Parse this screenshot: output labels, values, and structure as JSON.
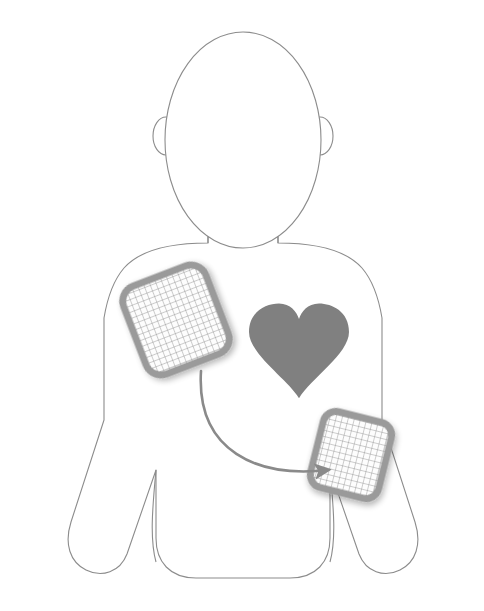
{
  "diagram": {
    "background_color": "#ffffff",
    "canvas": {
      "width": 484,
      "height": 611
    }
  },
  "body_outline": {
    "name": "torso-and-head-outline",
    "stroke_color": "#8c8c8c",
    "fill_color": "#ffffff",
    "stroke_width": 1.1,
    "head": {
      "label": "head",
      "shape": "ellipse",
      "cx": 243,
      "cy": 140,
      "rx": 78,
      "ry": 108
    },
    "ear_left": {
      "label": "left-ear",
      "cx": 166,
      "cy": 136,
      "rx": 13,
      "ry": 19
    },
    "ear_right": {
      "label": "right-ear",
      "cx": 320,
      "cy": 136,
      "rx": 13,
      "ry": 19
    },
    "neck": {
      "label": "neck",
      "left_x": 208,
      "right_x": 279,
      "top_y": 232,
      "bottom_y": 243
    },
    "torso": {
      "label": "torso",
      "left_x": 104,
      "right_x": 382,
      "top_y": 243,
      "bottom_y": 578,
      "corner_radius": 40
    },
    "arm_left": {
      "label": "left-arm",
      "shoulder_x": 104,
      "hand_y": 572
    },
    "arm_right": {
      "label": "right-arm",
      "shoulder_x": 382,
      "hand_y": 572
    }
  },
  "heart": {
    "name": "heart",
    "label": "Heart",
    "fill_color": "#808080",
    "center_x": 299,
    "center_y": 352,
    "width": 100,
    "height": 85
  },
  "pads": [
    {
      "id": "pad-upper-right-chest",
      "label": "Upper right chest pad",
      "position_note": "below the right collarbone (viewer's left)",
      "center_x": 176,
      "center_y": 320,
      "width": 88,
      "height": 94,
      "rotation_deg": -21,
      "corner_radius": 16,
      "border_color": "#9a9a9a",
      "border_width": 7,
      "mesh_color": "#8e8e8e",
      "mesh_spacing": 6,
      "fill_color": "#fdfdfd"
    },
    {
      "id": "pad-lower-left-chest",
      "label": "Lower left chest pad",
      "position_note": "lower left side below the armpit (viewer's right)",
      "center_x": 351,
      "center_y": 455,
      "width": 70,
      "height": 78,
      "rotation_deg": 14,
      "corner_radius": 13,
      "border_color": "#9a9a9a",
      "border_width": 7,
      "mesh_color": "#8e8e8e",
      "mesh_spacing": 6,
      "fill_color": "#fdfdfd"
    }
  ],
  "arrow": {
    "name": "placement-arrow",
    "label": "Arrow from upper chest pad to lower side pad",
    "color": "#8a8a8a",
    "stroke_width": 2.6,
    "start_x": 201,
    "start_y": 371,
    "end_x": 328,
    "end_y": 470,
    "control1_x": 196,
    "control1_y": 452,
    "control2_x": 258,
    "control2_y": 478,
    "arrowhead_size": 15
  }
}
